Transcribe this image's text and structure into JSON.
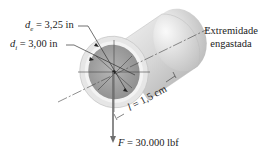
{
  "diagram": {
    "type": "hollow-tube-cantilever",
    "labels": {
      "outer_diameter_symbol": "d",
      "outer_diameter_sub": "e",
      "outer_diameter_value": " = 3,25 in",
      "inner_diameter_symbol": "d",
      "inner_diameter_sub": "i",
      "inner_diameter_value": " = 3,00 in",
      "length_symbol": "l",
      "length_value": " = 1,5 cm",
      "force_symbol": "F",
      "force_value": " = 30.000 lbf",
      "fixed_end_line1": "Extremidade",
      "fixed_end_line2": "engastada"
    },
    "colors": {
      "tube_body": "#c8c8c8",
      "tube_highlight": "#f2f2f2",
      "inner_face": "#9a9a9a",
      "ring_face": "#e4e4e4",
      "lines": "#333333",
      "force_arrow": "#666666"
    }
  }
}
